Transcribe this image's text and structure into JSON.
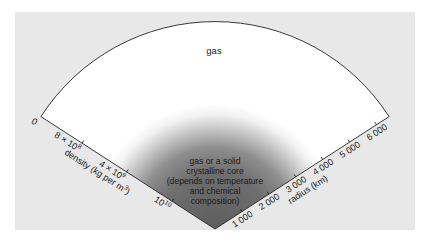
{
  "diagram": {
    "outer_label": "gas",
    "core_label_lines": [
      "gas or a solid",
      "crystalline core",
      "(depends on temperature",
      "and chemical",
      "composition)"
    ],
    "density_axis": {
      "title": "density (kg per m",
      "title_superscript": "3",
      "title_close": ")",
      "ticks": [
        {
          "base": "0",
          "sup": ""
        },
        {
          "base": "8 × 10",
          "sup": "8"
        },
        {
          "base": "4 × 10",
          "sup": "9"
        },
        {
          "base": "10",
          "sup": "10"
        }
      ]
    },
    "radius_axis": {
      "title": "radius (km)",
      "ticks": [
        "1 000",
        "2 000",
        "3 000",
        "4 000",
        "5 000",
        "6 000"
      ]
    },
    "colors": {
      "page": "#ffffff",
      "panel": "#e8e8e8",
      "sector": "#ffffff",
      "core_dark": "#6b6b6b",
      "outline": "#222222"
    }
  }
}
